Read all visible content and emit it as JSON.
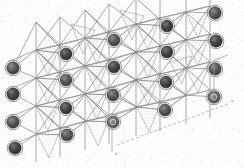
{
  "figure": {
    "kind": "crystal-structure-diagram",
    "title": "",
    "caption": "",
    "rendering": "polyhedral framework, oblique projection, grayscale scan",
    "background_color": "#fdfdfd"
  },
  "palette": {
    "atom_fill": "#555555",
    "atom_fill_dark": "#3d3d3d",
    "atom_ring": "#6e6e6e",
    "atom_outline": "#2e2e2e",
    "polyhedron_face_light": "#d8d8d8",
    "polyhedron_face_mid": "#c9c9c9",
    "polyhedron_face_pale": "#e6e6e6",
    "edge_line": "#8d8d8d",
    "edge_line_dark": "#6b6b6b",
    "bond_line": "#7f7f7f",
    "axis_line": "#9a9a9a",
    "axis_label": "#7a7a7a"
  },
  "axes": {
    "items": [
      {
        "id": "axis-vertical",
        "label": "b",
        "x1": 112,
        "y1": 122,
        "x2": 112,
        "y2": 152,
        "style": "solid",
        "label_x": 115,
        "label_y": 155
      },
      {
        "id": "axis-diagonal",
        "label": "a",
        "x1": 117,
        "y1": 145,
        "x2": 228,
        "y2": 104,
        "style": "dashed",
        "label_x": 231,
        "label_y": 102
      },
      {
        "id": "axis-right-vertical",
        "label": "c",
        "x1": 214,
        "y1": 60,
        "x2": 214,
        "y2": 100,
        "style": "solid",
        "label_x": 217,
        "label_y": 60
      },
      {
        "id": "axis-right-corner",
        "label": "",
        "x1": 214,
        "y1": 60,
        "x2": 228,
        "y2": 55,
        "style": "solid",
        "label_x": 0,
        "label_y": 0
      }
    ]
  },
  "layers": {
    "front": {
      "label": "front polyhedral slab",
      "opacity": 1
    },
    "back": {
      "label": "back polyhedral slab",
      "opacity": 0.85
    }
  },
  "atoms": {
    "legend_note": "dark spheres = cation sites",
    "radius_large": 6.2,
    "radius_small": 5.2,
    "items": [
      {
        "id": "a01",
        "cx": 13,
        "cy": 68,
        "r": 6.2,
        "shade": "mid"
      },
      {
        "id": "a02",
        "cx": 13,
        "cy": 94,
        "r": 6.2,
        "shade": "dark"
      },
      {
        "id": "a03",
        "cx": 13,
        "cy": 122,
        "r": 6.2,
        "shade": "mid"
      },
      {
        "id": "a04",
        "cx": 15,
        "cy": 148,
        "r": 6.2,
        "shade": "dark"
      },
      {
        "id": "b01",
        "cx": 66,
        "cy": 54,
        "r": 6.0,
        "shade": "dark"
      },
      {
        "id": "b02",
        "cx": 66,
        "cy": 80,
        "r": 6.0,
        "shade": "mid"
      },
      {
        "id": "b03",
        "cx": 66,
        "cy": 108,
        "r": 6.0,
        "shade": "dark"
      },
      {
        "id": "b04",
        "cx": 67,
        "cy": 135,
        "r": 6.0,
        "shade": "mid"
      },
      {
        "id": "c01",
        "cx": 114,
        "cy": 40,
        "r": 6.0,
        "shade": "mid"
      },
      {
        "id": "c02",
        "cx": 114,
        "cy": 67,
        "r": 6.0,
        "shade": "dark"
      },
      {
        "id": "c03",
        "cx": 113,
        "cy": 95,
        "r": 6.0,
        "shade": "mid"
      },
      {
        "id": "c04",
        "cx": 113,
        "cy": 122,
        "r": 6.0,
        "shade": "ring"
      },
      {
        "id": "d01",
        "cx": 167,
        "cy": 26,
        "r": 6.0,
        "shade": "dark"
      },
      {
        "id": "d02",
        "cx": 167,
        "cy": 52,
        "r": 6.0,
        "shade": "dark"
      },
      {
        "id": "d03",
        "cx": 166,
        "cy": 82,
        "r": 6.0,
        "shade": "dark"
      },
      {
        "id": "d04",
        "cx": 165,
        "cy": 110,
        "r": 6.0,
        "shade": "mid"
      },
      {
        "id": "e01",
        "cx": 215,
        "cy": 13,
        "r": 6.2,
        "shade": "mid"
      },
      {
        "id": "e02",
        "cx": 216,
        "cy": 41,
        "r": 6.2,
        "shade": "dark"
      },
      {
        "id": "e03",
        "cx": 215,
        "cy": 69,
        "r": 6.2,
        "shade": "mid"
      },
      {
        "id": "e04",
        "cx": 214,
        "cy": 97,
        "r": 6.2,
        "shade": "ring"
      }
    ]
  },
  "polyhedra": {
    "note": "shaded triangular faces of corner-sharing polyhedra",
    "faces": [
      {
        "id": "f01",
        "points": "36,50 60,45 48,76",
        "tone": "light"
      },
      {
        "id": "f02",
        "points": "36,78 60,72 48,103",
        "tone": "pale"
      },
      {
        "id": "f03",
        "points": "36,106 60,100 48,131",
        "tone": "light"
      },
      {
        "id": "f04",
        "points": "37,134 61,128 49,158",
        "tone": "pale"
      },
      {
        "id": "f05",
        "points": "85,38 109,32 97,64",
        "tone": "light"
      },
      {
        "id": "f06",
        "points": "85,66 109,60 97,92",
        "tone": "mid"
      },
      {
        "id": "f07",
        "points": "85,94 109,88 97,119",
        "tone": "light"
      },
      {
        "id": "f08",
        "points": "86,121 110,116 98,146",
        "tone": "pale"
      },
      {
        "id": "f09",
        "points": "136,24 160,18 148,50",
        "tone": "pale"
      },
      {
        "id": "f10",
        "points": "136,52 160,46 148,78",
        "tone": "light"
      },
      {
        "id": "f11",
        "points": "136,80 160,74 148,105",
        "tone": "mid"
      },
      {
        "id": "f12",
        "points": "137,107 161,102 149,132",
        "tone": "light"
      },
      {
        "id": "f13",
        "points": "186,12 210,6 198,38",
        "tone": "pale"
      },
      {
        "id": "f14",
        "points": "186,40 210,34 198,66",
        "tone": "light"
      },
      {
        "id": "f15",
        "points": "186,68 210,62 198,93",
        "tone": "pale"
      },
      {
        "id": "f16",
        "points": "120,10 144,16 132,40",
        "tone": "pale"
      },
      {
        "id": "f17",
        "points": "71,24 95,30 83,54",
        "tone": "pale"
      },
      {
        "id": "f18",
        "points": "170,62 192,56 182,84",
        "tone": "light"
      }
    ]
  },
  "framework": {
    "note": "wireframe edges of the corner-linked polyhedral chains",
    "column_x": [
      13,
      36,
      60,
      85,
      109,
      136,
      160,
      186,
      210,
      228
    ],
    "row_offsets": [
      0,
      28,
      28,
      27
    ]
  },
  "annotations": {
    "scale_bar": "",
    "labels": []
  }
}
